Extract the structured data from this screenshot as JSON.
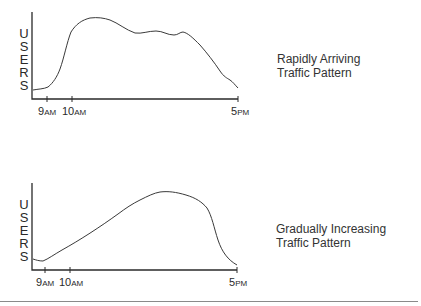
{
  "charts": [
    {
      "id": "rapid",
      "caption_line1": "Rapidly Arriving",
      "caption_line2": "Traffic Pattern",
      "y_label": "USERS",
      "x_ticks": [
        {
          "big": "9",
          "small": "AM"
        },
        {
          "big": "10",
          "small": "AM"
        },
        {
          "big": "5",
          "small": "PM"
        }
      ]
    },
    {
      "id": "gradual",
      "caption_line1": "Gradually Increasing",
      "caption_line2": "Traffic Pattern",
      "y_label": "USERS",
      "x_ticks": [
        {
          "big": "9",
          "small": "AM"
        },
        {
          "big": "10",
          "small": "AM"
        },
        {
          "big": "5",
          "small": "PM"
        }
      ]
    }
  ],
  "colors": {
    "line": "#3a3a3a",
    "rule": "#8a8a8a"
  }
}
